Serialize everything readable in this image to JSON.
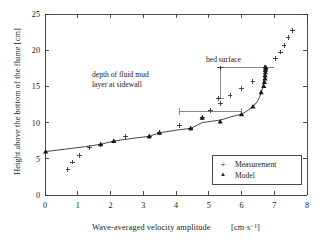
{
  "chart_data": {
    "type": "scatter",
    "title": "",
    "xlabel": "Wave-averaged velocity amplitude",
    "xunit": "[cm·s⁻¹]",
    "ylabel": "Height above the bottom of the flume  [cm]",
    "xlim": [
      0,
      8
    ],
    "ylim": [
      0,
      25
    ],
    "xticks": [
      0,
      1,
      2,
      3,
      4,
      5,
      6,
      7,
      8
    ],
    "yticks": [
      0,
      5,
      10,
      15,
      20,
      25
    ],
    "xtick_labels": [
      "0",
      "1",
      "2",
      "3",
      "4",
      "5",
      "6",
      "7",
      "8"
    ],
    "ytick_labels": [
      "0",
      "5",
      "10",
      "15",
      "20",
      "25"
    ],
    "grid": false,
    "legend_position": "lower right",
    "series": [
      {
        "name": "Measurement",
        "marker": "plus",
        "x": [
          0.7,
          0.84,
          1.06,
          1.35,
          1.7,
          2.1,
          2.45,
          3.18,
          3.5,
          4.1,
          4.45,
          4.8,
          5.05,
          5.35,
          5.65,
          6.0,
          6.35,
          5.3,
          5.35,
          6.7,
          7.05,
          7.2,
          7.3,
          7.42,
          7.55
        ],
        "y": [
          3.55,
          4.55,
          5.5,
          6.6,
          7.0,
          7.45,
          8.1,
          8.1,
          8.6,
          9.65,
          9.2,
          10.65,
          11.65,
          12.65,
          13.7,
          14.75,
          15.65,
          13.3,
          17.55,
          17.65,
          18.8,
          19.75,
          20.7,
          21.75,
          22.7
        ]
      },
      {
        "name": "Model",
        "marker": "triangle",
        "x": [
          0.02,
          1.7,
          2.1,
          3.18,
          3.5,
          4.45,
          4.8,
          5.35,
          6.0,
          6.35,
          6.6,
          6.68,
          6.7,
          6.72,
          6.72,
          6.73,
          6.73,
          6.74,
          6.74
        ],
        "y": [
          6.0,
          7.0,
          7.45,
          8.1,
          8.6,
          9.2,
          10.65,
          10.15,
          11.15,
          12.2,
          14.2,
          15.05,
          15.6,
          16.1,
          16.55,
          16.95,
          17.25,
          17.5,
          17.65
        ]
      }
    ],
    "model_curve": [
      [
        0.02,
        6.0
      ],
      [
        0.6,
        6.32
      ],
      [
        1.2,
        6.66
      ],
      [
        1.7,
        7.0
      ],
      [
        2.1,
        7.45
      ],
      [
        2.6,
        7.78
      ],
      [
        3.18,
        8.1
      ],
      [
        3.5,
        8.6
      ],
      [
        4.0,
        8.95
      ],
      [
        4.45,
        9.2
      ],
      [
        4.8,
        10.0
      ],
      [
        5.35,
        10.35
      ],
      [
        5.8,
        10.95
      ],
      [
        6.0,
        11.15
      ],
      [
        6.2,
        11.7
      ],
      [
        6.35,
        12.2
      ],
      [
        6.48,
        12.9
      ],
      [
        6.56,
        13.6
      ],
      [
        6.62,
        14.4
      ],
      [
        6.66,
        15.2
      ],
      [
        6.69,
        16.1
      ],
      [
        6.71,
        16.9
      ],
      [
        6.73,
        17.65
      ]
    ],
    "annotations": [
      {
        "name": "bed-surface",
        "text": "bed surface",
        "kind": "vertical-range",
        "x": 5.35,
        "y_from": 13.3,
        "y_to": 17.55,
        "rule_from_x": 5.35,
        "rule_to_x": 7.0,
        "rule_y": 17.55
      },
      {
        "name": "depth-of-fluid-mud",
        "text_line1": "depth of fluid mud",
        "text_line2": "layer at sidewall",
        "kind": "horizontal-range",
        "y": 11.55,
        "x_from": 4.1,
        "x_to": 6.0
      }
    ],
    "legend": [
      {
        "label": "Measurement",
        "marker_glyph": "+"
      },
      {
        "label": "Model",
        "marker_glyph": "▲"
      }
    ],
    "colors": {
      "axis": "#3a3a3a",
      "measurement": "#2b2b2b",
      "model": "#1a1a1a",
      "annotation": "#6b6b6b",
      "background": "#ffffff"
    }
  }
}
